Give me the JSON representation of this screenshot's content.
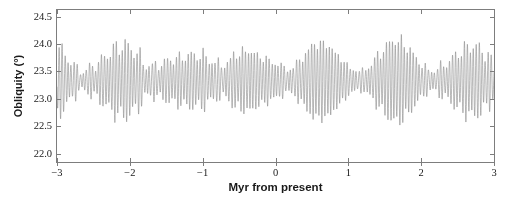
{
  "figure": {
    "background_color": "#ffffff",
    "plot_background_color": "#ffffff",
    "frame_color": "#7d7d7d"
  },
  "chart_data": {
    "type": "line",
    "title": "",
    "subtitle": "",
    "xlabel": "Myr from present",
    "ylabel": "Obliquity (°)",
    "xlim": [
      -3,
      3
    ],
    "ylim": [
      21.85,
      24.62
    ],
    "grid": false,
    "legend": null,
    "legend_position": "none",
    "line_color": "#8a8a8a",
    "line_width": 0.6,
    "x_ticks": [
      -3,
      -2,
      -1,
      0,
      1,
      2,
      3
    ],
    "x_tick_labels": [
      "−3",
      "−2",
      "−1",
      "0",
      "1",
      "2",
      "3"
    ],
    "y_ticks": [
      22.0,
      22.5,
      23.0,
      23.5,
      24.0,
      24.5
    ],
    "y_tick_labels": [
      "22.0",
      "22.5",
      "23.0",
      "23.5",
      "24.0",
      "24.5"
    ],
    "series": [
      {
        "name": "Obliquity",
        "description": "Earth's axial obliquity over ±3 Myr: quasi-periodic oscillation with a dominant ~41 kyr period, amplitude modulated on ~1.2 Myr and ~170 kyr envelopes.",
        "mean": 23.33,
        "primary_period_myr": 0.0412,
        "secondary_periods_myr": [
          0.0395,
          0.0536,
          0.0299
        ],
        "envelope_periods_myr": [
          1.2,
          0.173
        ],
        "base_amplitude_deg": 0.62,
        "envelope_depth": 0.42,
        "min_value": 22.02,
        "max_value": 24.47,
        "n_samples": 3000
      }
    ],
    "annotations": []
  }
}
